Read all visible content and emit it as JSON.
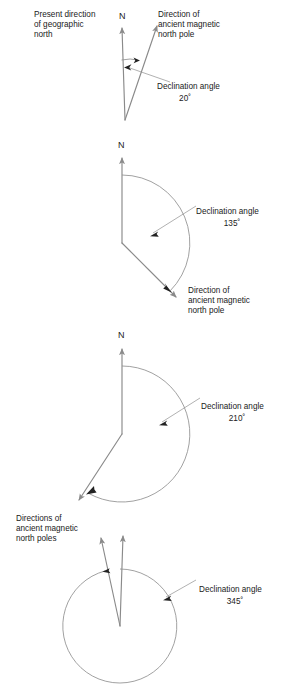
{
  "figure": {
    "background_color": "#ffffff",
    "line_color": "#8a8a8a",
    "text_color": "#1a1a1a",
    "degree_symbol": "˚"
  },
  "panels": [
    {
      "id": "panel-20",
      "labels": {
        "geographic_north": "Present direction\nof geographic\nnorth",
        "geographic_north_line1": "Present direction",
        "geographic_north_line2": "of geographic",
        "geographic_north_line3": "north",
        "north_marker": "N",
        "ancient_pole_line1": "Direction of",
        "ancient_pole_line2": "ancient magnetic",
        "ancient_pole_line3": "north pole",
        "declination_label": "Declination angle",
        "declination_value": "20˚"
      },
      "declination_degrees": 20
    },
    {
      "id": "panel-135",
      "labels": {
        "north_marker": "N",
        "ancient_pole_line1": "Direction of",
        "ancient_pole_line2": "ancient magnetic",
        "ancient_pole_line3": "north pole",
        "declination_label": "Declination angle",
        "declination_value": "135˚"
      },
      "declination_degrees": 135
    },
    {
      "id": "panel-210",
      "labels": {
        "north_marker": "N",
        "declination_label": "Declination angle",
        "declination_value": "210˚"
      },
      "declination_degrees": 210
    },
    {
      "id": "panel-345",
      "labels": {
        "ancient_poles_line1": "Directions of",
        "ancient_poles_line2": "ancient magnetic",
        "ancient_poles_line3": "north poles",
        "declination_label": "Declination angle",
        "declination_value": "345˚"
      },
      "declination_degrees": 345
    }
  ]
}
